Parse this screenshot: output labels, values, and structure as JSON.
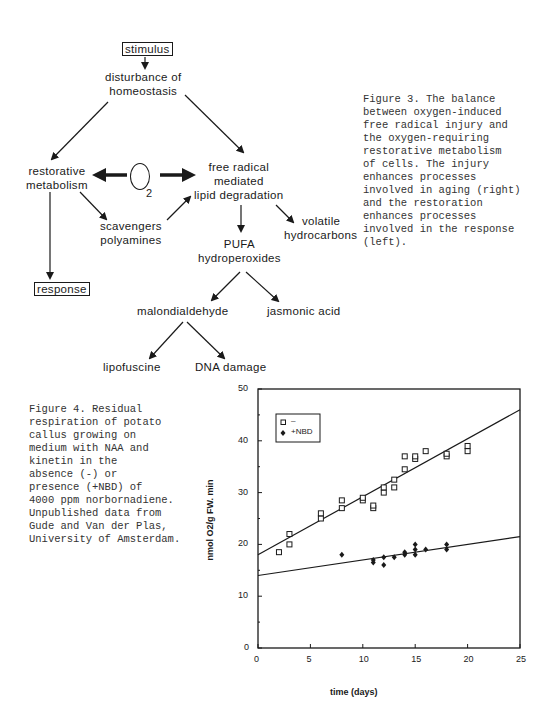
{
  "figure3": {
    "nodes": {
      "stimulus": "stimulus",
      "disturbance_1": "disturbance  of",
      "disturbance_2": "homeostasis",
      "restorative_1": "restorative",
      "restorative_2": "metabolism",
      "o2_letter": "O",
      "o2_sub": "2",
      "free_radical_1": "free  radical",
      "free_radical_2": "mediated",
      "free_radical_3": "lipid  degradation",
      "scavengers_1": "scavengers",
      "scavengers_2": "polyamines",
      "volatile_1": "volatile",
      "volatile_2": "hydrocarbons",
      "pufa_1": "PUFA",
      "pufa_2": "hydroperoxides",
      "response": "response",
      "malondialdehyde": "malondialdehyde",
      "jasmonic": "jasmonic  acid",
      "lipofuscine": "lipofuscine",
      "dna_damage": "DNA damage"
    },
    "caption": "Figure 3. The balance\nbetween oxygen-induced\nfree radical injury and\nthe oxygen-requiring\nrestorative metabolism\nof cells. The injury\nenhances processes\ninvolved in aging (right)\nand the restoration\nenhances processes\ninvolved in the response\n(left)."
  },
  "figure4": {
    "caption": "Figure 4. Residual\nrespiration of potato\ncallus growing on\nmedium with NAA and\nkinetin in the\nabsence (-) or\npresence (+NBD) of\n4000 ppm norbornadiene.\nUnpublished data from\nGude and Van der Plas,\nUniversity of Amsterdam."
  },
  "chart_data": {
    "type": "scatter",
    "title": "",
    "xlabel": "time (days)",
    "ylabel": "nmol O2/g FW. min",
    "xlim": [
      0,
      25
    ],
    "ylim": [
      0,
      50
    ],
    "x_ticks": [
      "0",
      "5",
      "10",
      "15",
      "20",
      "25"
    ],
    "y_ticks": [
      "0",
      "10",
      "20",
      "30",
      "40",
      "50"
    ],
    "grid": false,
    "legend_position": "upper-left (inside box)",
    "series": [
      {
        "name": "–",
        "marker": "square",
        "points": [
          [
            2,
            18.5
          ],
          [
            3,
            20
          ],
          [
            3,
            22
          ],
          [
            6,
            25
          ],
          [
            6,
            26
          ],
          [
            8,
            27
          ],
          [
            8,
            28.5
          ],
          [
            10,
            28.5
          ],
          [
            10,
            29
          ],
          [
            11,
            27
          ],
          [
            11,
            27.5
          ],
          [
            12,
            30
          ],
          [
            12,
            31
          ],
          [
            13,
            31
          ],
          [
            13,
            32.5
          ],
          [
            14,
            34.5
          ],
          [
            14,
            37
          ],
          [
            15,
            36.5
          ],
          [
            15,
            37
          ],
          [
            16,
            38
          ],
          [
            18,
            37
          ],
          [
            18,
            37.5
          ],
          [
            20,
            38
          ],
          [
            20,
            39
          ]
        ],
        "fit_line": [
          [
            0,
            18
          ],
          [
            25,
            46
          ]
        ]
      },
      {
        "name": "+NBD",
        "marker": "diamond",
        "points": [
          [
            8,
            18
          ],
          [
            11,
            16.5
          ],
          [
            11,
            17
          ],
          [
            12,
            16
          ],
          [
            12,
            17.5
          ],
          [
            13,
            17.5
          ],
          [
            14,
            18
          ],
          [
            14,
            18.5
          ],
          [
            15,
            18
          ],
          [
            15,
            19
          ],
          [
            15,
            20
          ],
          [
            16,
            19
          ],
          [
            18,
            19
          ],
          [
            18,
            20
          ]
        ],
        "fit_line": [
          [
            0,
            14
          ],
          [
            25,
            21.5
          ]
        ]
      }
    ]
  }
}
